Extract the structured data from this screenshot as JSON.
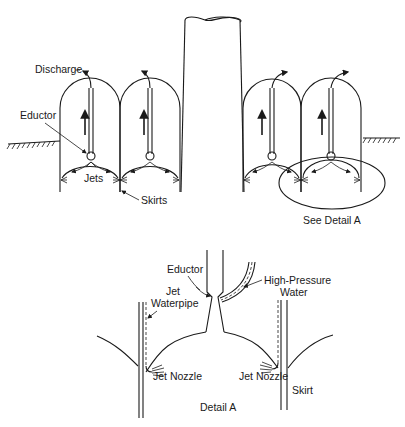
{
  "figure": {
    "upper_view": {
      "labels": {
        "discharge": "Discharge",
        "eductor": "Eductor",
        "jets": "Jets",
        "skirts": "Skirts",
        "see_detail": "See Detail A"
      }
    },
    "detail_view": {
      "title": "Detail A",
      "labels": {
        "eductor": "Eductor",
        "high_pressure_line1": "High-Pressure",
        "high_pressure_line2": "Water",
        "jet_waterpipe_line1": "Jet",
        "jet_waterpipe_line2": "Waterpipe",
        "jet_nozzle_left": "Jet Nozzle",
        "jet_nozzle_right": "Jet Nozzle",
        "skirt": "Skirt"
      }
    }
  }
}
